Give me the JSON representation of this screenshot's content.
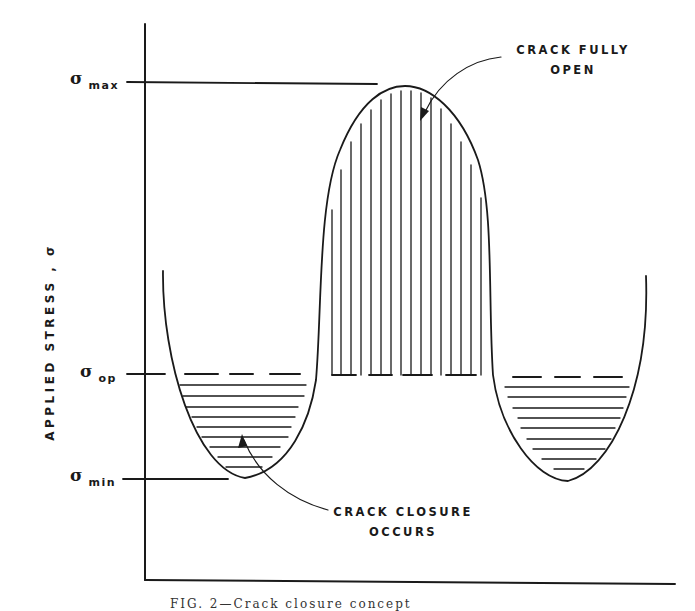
{
  "figure": {
    "y_axis_label": "APPLIED STRESS , σ",
    "levels": {
      "max": {
        "symbol": "σ",
        "subscript": "max"
      },
      "op": {
        "symbol": "σ",
        "subscript": "op"
      },
      "min": {
        "symbol": "σ",
        "subscript": "min"
      }
    },
    "annotations": {
      "open_line1": "CRACK FULLY",
      "open_line2": "OPEN",
      "closure_line1": "CRACK CLOSURE",
      "closure_line2": "OCCURS"
    },
    "caption": "FIG. 2—Crack closure concept"
  },
  "colors": {
    "ink": "#1a1a1a",
    "background": "#ffffff"
  }
}
